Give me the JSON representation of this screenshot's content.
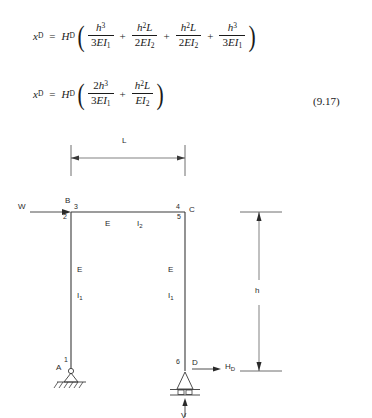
{
  "equations": {
    "eq1": {
      "lhs_var": "x",
      "lhs_sub": "D",
      "equals": "=",
      "rhs_var": "H",
      "rhs_sub": "D",
      "open_paren": "(",
      "close_paren": ")",
      "plus": "+",
      "terms": [
        {
          "num_base": "h",
          "num_sup": "3",
          "num_tail": "",
          "den_coef": "3",
          "den_body": "EI",
          "den_sub": "1"
        },
        {
          "num_base": "h",
          "num_sup": "2",
          "num_tail": "L",
          "den_coef": "2",
          "den_body": "EI",
          "den_sub": "2"
        },
        {
          "num_base": "h",
          "num_sup": "2",
          "num_tail": "L",
          "den_coef": "2",
          "den_body": "EI",
          "den_sub": "2"
        },
        {
          "num_base": "h",
          "num_sup": "3",
          "num_tail": "",
          "den_coef": "3",
          "den_body": "EI",
          "den_sub": "1"
        }
      ]
    },
    "eq2": {
      "lhs_var": "x",
      "lhs_sub": "D",
      "equals": "=",
      "rhs_var": "H",
      "rhs_sub": "D",
      "open_paren": "(",
      "close_paren": ")",
      "plus": "+",
      "terms": [
        {
          "num_coef": "2",
          "num_base": "h",
          "num_sup": "3",
          "num_tail": "",
          "den_coef": "3",
          "den_body": "EI",
          "den_sub": "1"
        },
        {
          "num_coef": "",
          "num_base": "h",
          "num_sup": "2",
          "num_tail": "L",
          "den_coef": "",
          "den_body": "EI",
          "den_sub": "2"
        }
      ]
    },
    "number": "(9.17)"
  },
  "diagram": {
    "span_dimension": {
      "label": "L"
    },
    "height_dimension": {
      "label": "h"
    },
    "load": {
      "label": "W"
    },
    "reaction_horizontal": {
      "label": "H",
      "sub": "D"
    },
    "reaction_vertical": {
      "label": "V"
    },
    "joints": [
      {
        "name": "joint-B",
        "label": "B"
      },
      {
        "name": "joint-C",
        "label": "C"
      },
      {
        "name": "joint-A",
        "label": "A"
      },
      {
        "name": "joint-D",
        "label": "D"
      }
    ],
    "node_numbers": [
      {
        "name": "node-1",
        "label": "1"
      },
      {
        "name": "node-2",
        "label": "2"
      },
      {
        "name": "node-3",
        "label": "3"
      },
      {
        "name": "node-4",
        "label": "4"
      },
      {
        "name": "node-5",
        "label": "5"
      },
      {
        "name": "node-6",
        "label": "6"
      }
    ],
    "member_properties": {
      "beam": {
        "modulus": "E",
        "inertia_base": "I",
        "inertia_sub": "2"
      },
      "left_column": {
        "modulus": "E",
        "inertia_base": "I",
        "inertia_sub": "1"
      },
      "right_column": {
        "modulus": "E",
        "inertia_base": "I",
        "inertia_sub": "1"
      }
    },
    "colors": {
      "line": "#3a3a3a",
      "text": "#2a2a2a",
      "background": "#ffffff"
    }
  }
}
